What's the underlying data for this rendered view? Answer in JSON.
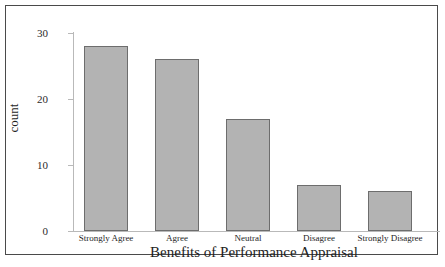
{
  "chart_data": {
    "type": "bar",
    "title": "",
    "xlabel": "Benefits of Performance Appraisal",
    "ylabel": "count",
    "categories": [
      "Strongly Agree",
      "Agree",
      "Neutral",
      "Disagree",
      "Strongly Disagree"
    ],
    "values": [
      28,
      26,
      17,
      7,
      6
    ],
    "ylim": [
      0,
      30
    ],
    "yticks": [
      0,
      10,
      20,
      30
    ],
    "ytick_labels": [
      "0",
      "10",
      "20",
      "30"
    ],
    "grid": false,
    "legend": null,
    "colors": {
      "bar_fill": "#b3b3b3",
      "bar_edge": "#6d6d6d",
      "axis_line": "#b9b9b9",
      "text": "#1e1e1e",
      "frame": "#4a4a4a",
      "background": "#ffffff"
    }
  }
}
